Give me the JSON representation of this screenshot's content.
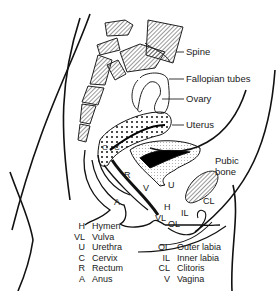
{
  "figure": {
    "type": "sagittal anatomical diagram",
    "callouts": {
      "spine": "Spine",
      "fallopian_tubes": "Fallopian tubes",
      "ovary": "Ovary",
      "uterus": "Uterus",
      "pubic_bone_1": "Pubic",
      "pubic_bone_2": "bone"
    },
    "inline_letters": {
      "C1": "C",
      "C2": "C",
      "R": "R",
      "A": "A",
      "V": "V",
      "U": "U",
      "H": "H",
      "VL": "VL",
      "OL": "OL",
      "IL": "IL",
      "CL": "CL"
    }
  },
  "legend": {
    "left": [
      {
        "abbr": "H",
        "name": "Hymen"
      },
      {
        "abbr": "VL",
        "name": "Vulva"
      },
      {
        "abbr": "U",
        "name": "Urethra"
      },
      {
        "abbr": "C",
        "name": "Cervix"
      },
      {
        "abbr": "R",
        "name": "Rectum"
      },
      {
        "abbr": "A",
        "name": "Anus"
      }
    ],
    "right": [
      {
        "abbr": "OL",
        "name": "Outer labia"
      },
      {
        "abbr": "IL",
        "name": "Inner labia"
      },
      {
        "abbr": "CL",
        "name": "Clitoris"
      },
      {
        "abbr": "V",
        "name": "Vagina"
      }
    ]
  }
}
